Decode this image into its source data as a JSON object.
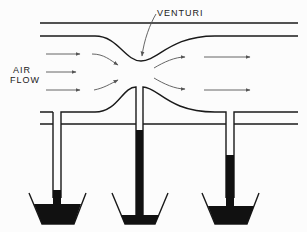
{
  "diagram": {
    "labels": {
      "venturi": "VENTURI",
      "air_line1": "AIR",
      "air_line2": "FLOW"
    },
    "tubes": [
      {
        "name": "left",
        "fluid_top_y": 190
      },
      {
        "name": "center",
        "fluid_top_y": 130
      },
      {
        "name": "right",
        "fluid_top_y": 155
      }
    ],
    "colors": {
      "line": "#1a1a1a",
      "fluid": "#111111",
      "arrow": "#555555"
    }
  }
}
